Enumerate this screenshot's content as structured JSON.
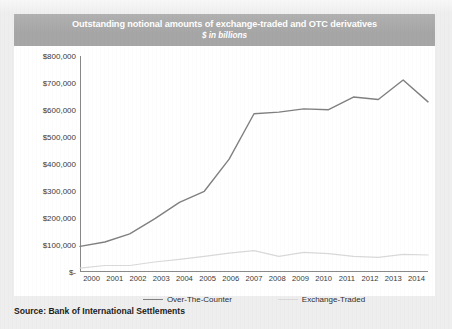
{
  "page": {
    "source_note": "Source: Bank of International Settlements",
    "background_color": "#efeeee"
  },
  "chart_header": {
    "title": "Outstanding notional amounts of exchange-traded and OTC derivatives",
    "subtitle": "$ in billions",
    "bar_color": "#a6a6a6",
    "text_color": "#ffffff"
  },
  "legend": {
    "items": [
      {
        "label": "Over-The-Counter",
        "color": "#808080"
      },
      {
        "label": "Exchange-Traded",
        "color": "#d9d9d9"
      }
    ]
  },
  "chart_data": {
    "type": "line",
    "title": "Outstanding notional amounts of exchange-traded and OTC derivatives",
    "subtitle": "$ in billions",
    "xlabel": "",
    "ylabel": "",
    "grid": false,
    "legend_position": "bottom",
    "categories": [
      "2000",
      "2001",
      "2002",
      "2003",
      "2004",
      "2005",
      "2006",
      "2007",
      "2008",
      "2009",
      "2010",
      "2011",
      "2012",
      "2013",
      "2014"
    ],
    "ylim": [
      0,
      800000
    ],
    "yticks": [
      0,
      100000,
      200000,
      300000,
      400000,
      500000,
      600000,
      700000,
      800000
    ],
    "ytick_labels": [
      "$-",
      "$100,000",
      "$200,000",
      "$300,000",
      "$400,000",
      "$500,000",
      "$600,000",
      "$700,000",
      "$800,000"
    ],
    "series": [
      {
        "name": "Over-The-Counter",
        "color": "#808080",
        "values": [
          95000,
          111000,
          141000,
          197000,
          258000,
          299000,
          418000,
          586000,
          592000,
          604000,
          601000,
          648000,
          639000,
          711000,
          630000
        ]
      },
      {
        "name": "Exchange-Traded",
        "color": "#d9d9d9",
        "values": [
          14000,
          24000,
          24000,
          37000,
          47000,
          58000,
          70000,
          79000,
          58000,
          73000,
          68000,
          58000,
          54000,
          65000,
          63000
        ]
      }
    ]
  }
}
